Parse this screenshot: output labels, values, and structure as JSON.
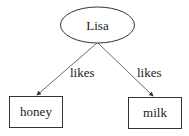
{
  "diagram": {
    "nodes": [
      {
        "id": "lisa",
        "label": "Lisa",
        "shape": "ellipse"
      },
      {
        "id": "honey",
        "label": "honey",
        "shape": "box"
      },
      {
        "id": "milk",
        "label": "milk",
        "shape": "box"
      }
    ],
    "edges": [
      {
        "from": "lisa",
        "to": "honey",
        "label": "likes"
      },
      {
        "from": "lisa",
        "to": "milk",
        "label": "likes"
      }
    ],
    "colors": {
      "stroke": "#333333",
      "background": "#ffffff"
    }
  }
}
